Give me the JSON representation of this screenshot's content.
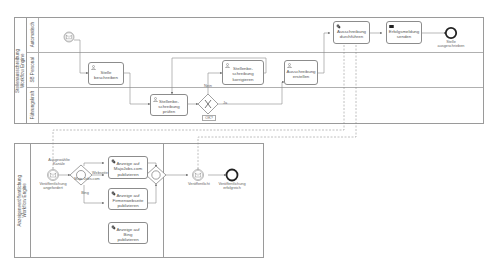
{
  "colors": {
    "stroke": "#8c8c8c",
    "lane_border": "#b0b0b0",
    "text": "#555555",
    "dashed": "#8c8c8c"
  },
  "pools": [
    {
      "label": "Stellenausschreibung\nWorkflow Engine",
      "lanes": [
        {
          "label": "Automatisch"
        },
        {
          "label": "SB Personal"
        },
        {
          "label": "Führungskraft"
        }
      ]
    },
    {
      "label": "Anzeigenveröffentlichung\nWorkflow Engine"
    }
  ],
  "top": {
    "start_event": {
      "icon": "envelope-icon"
    },
    "tasks": [
      {
        "id": "t1",
        "label": "Stelle\nbeschreiben",
        "icon": "user-icon"
      },
      {
        "id": "t2",
        "label": "Stellenbe-\nschreibung\nprüfen",
        "icon": "user-icon"
      },
      {
        "id": "t3",
        "label": "Stellenbe-\nschreibung\nkorrigieren",
        "icon": "user-icon"
      },
      {
        "id": "t4",
        "label": "Ausschreibung\nerstellen",
        "icon": "user-icon"
      },
      {
        "id": "t5",
        "label": "Ausschreibung\ndurchführen",
        "icon": "gear-icon"
      },
      {
        "id": "t6",
        "label": "Erfolgsmeldung\nsenden",
        "icon": "send-message-icon"
      }
    ],
    "gateway": {
      "label": "OK?",
      "icon": "x-icon"
    },
    "flow_labels": {
      "no": "Nein",
      "yes": "Ja"
    },
    "end_event": {
      "label": "Stelle\nausgeschrieben"
    }
  },
  "bottom": {
    "start_event": {
      "label": "Veröffentlichung\nangefordert",
      "icon": "envelope-icon"
    },
    "start_annotation": "Ausgewählte\nKanäle",
    "split_gateway": {
      "icon": "circle-icon"
    },
    "flow_labels": {
      "top": "Majo Jobs.com",
      "middle": "Webseite",
      "bottom": "Bing"
    },
    "tasks": [
      {
        "id": "b1",
        "label": "Anzeige auf\nMajoJobs.com\npublizieren",
        "icon": "gear-icon"
      },
      {
        "id": "b2",
        "label": "Anzeige auf\nFirmenwebseite\npublizieren",
        "icon": "gear-icon"
      },
      {
        "id": "b3",
        "label": "Anzeige auf Bing\npublizieren",
        "icon": "gear-icon"
      }
    ],
    "join_gateway": {
      "icon": "circle-icon"
    },
    "intermediate_event": {
      "label": "Veröffentlicht",
      "icon": "envelope-icon"
    },
    "end_event": {
      "label": "Veröffentlichung\nerfolgreich"
    }
  }
}
